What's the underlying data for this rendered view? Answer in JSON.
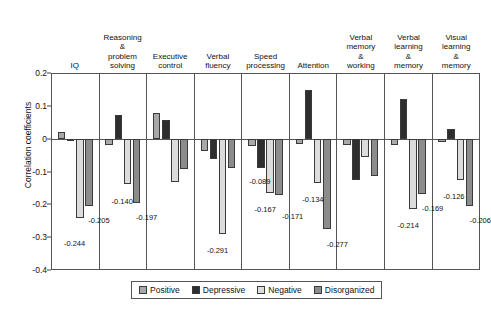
{
  "chart_data": {
    "type": "bar",
    "title": "",
    "xlabel": "",
    "ylabel": "Correlation coefficients",
    "ylim": [
      -0.4,
      0.2
    ],
    "yticks": [
      "0.2",
      "0.1",
      "0",
      "-0.1",
      "-0.2",
      "-0.3",
      "-0.4"
    ],
    "ytick_values": [
      0.2,
      0.1,
      0,
      -0.1,
      -0.2,
      -0.3,
      -0.4
    ],
    "grid": false,
    "legend_position": "bottom-center",
    "categories": [
      "IQ",
      "Reasoning & problem solving",
      "Executive control",
      "Verbal fluency",
      "Speed processing",
      "Attention",
      "Verbal memory & working",
      "Verbal learning & memory",
      "Visual learning & memory"
    ],
    "category_lines": [
      [
        "IQ"
      ],
      [
        "Reasoning",
        "&",
        "problem",
        "solving"
      ],
      [
        "Executive",
        "control"
      ],
      [
        "Verbal",
        "fluency"
      ],
      [
        "Speed",
        "processing"
      ],
      [
        "Attention"
      ],
      [
        "Verbal",
        "memory",
        "&",
        "working"
      ],
      [
        "Verbal",
        "learning",
        "&",
        "memory"
      ],
      [
        "Visual",
        "learning",
        "&",
        "memory"
      ]
    ],
    "series": [
      {
        "name": "Positive",
        "color": "#a8a8a8",
        "values": [
          0.022,
          -0.018,
          0.08,
          -0.037,
          -0.022,
          -0.014,
          -0.02,
          -0.018,
          -0.01
        ],
        "labels": [
          "",
          "",
          "",
          "",
          "",
          "",
          "",
          "",
          ""
        ]
      },
      {
        "name": "Depressive",
        "color": "#2e2e2e",
        "values": [
          0.0,
          0.075,
          0.058,
          -0.062,
          -0.089,
          0.152,
          -0.125,
          0.122,
          0.03
        ],
        "labels": [
          "",
          "",
          "",
          "",
          "-0.089",
          "",
          "",
          "",
          ""
        ]
      },
      {
        "name": "Negative",
        "color": "#dcdcdc",
        "values": [
          -0.244,
          -0.14,
          -0.133,
          -0.291,
          -0.167,
          -0.134,
          -0.055,
          -0.214,
          -0.126
        ],
        "labels": [
          "-0.244",
          "-0.140",
          "",
          "-0.291",
          "-0.167",
          "-0.134",
          "",
          "-0.214",
          "-0.126"
        ]
      },
      {
        "name": "Disorganized",
        "color": "#8c8c8c",
        "values": [
          -0.205,
          -0.197,
          -0.092,
          -0.089,
          -0.171,
          -0.277,
          -0.115,
          -0.169,
          -0.206
        ],
        "labels": [
          "-0.205",
          "-0.197",
          "",
          "",
          "-0.171",
          "-0.277",
          "",
          "-0.169",
          "-0.206"
        ]
      }
    ]
  },
  "legend": {
    "items": [
      {
        "label": "Positive",
        "color": "#a8a8a8"
      },
      {
        "label": "Depressive",
        "color": "#2e2e2e"
      },
      {
        "label": "Negative",
        "color": "#dcdcdc"
      },
      {
        "label": "Disorganized",
        "color": "#8c8c8c"
      }
    ]
  }
}
